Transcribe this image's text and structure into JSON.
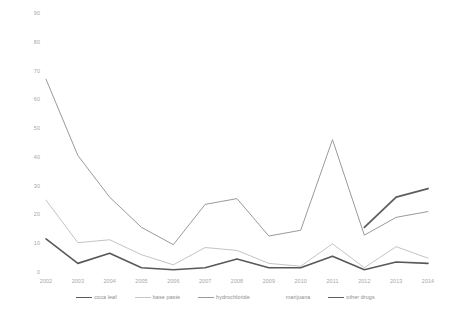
{
  "chart_data": {
    "type": "line",
    "title": "",
    "subtitle": "",
    "xlabel": "",
    "ylabel": "",
    "categories": [
      "2002",
      "2003",
      "2004",
      "2005",
      "2006",
      "2007",
      "2008",
      "2009",
      "2010",
      "2011",
      "2012",
      "2013",
      "2014"
    ],
    "x": [
      2002,
      2003,
      2004,
      2005,
      2006,
      2007,
      2008,
      2009,
      2010,
      2011,
      2012,
      2013,
      2014
    ],
    "ylim": [
      0,
      90
    ],
    "yticks": [
      0,
      10,
      20,
      30,
      40,
      50,
      60,
      70,
      80,
      90
    ],
    "ytick_labels": [
      "0",
      "10",
      "20",
      "30",
      "40",
      "50",
      "60",
      "70",
      "80",
      "90"
    ],
    "grid": false,
    "legend_position": "bottom",
    "series": [
      {
        "name": "coca leaf",
        "color": "#595959",
        "width": 1.6,
        "values": [
          11.5,
          3.0,
          6.5,
          1.5,
          0.8,
          1.5,
          4.5,
          1.5,
          1.5,
          5.5,
          0.8,
          3.5,
          3.0
        ]
      },
      {
        "name": "base paste",
        "color": "#c4c4c4",
        "width": 1.0,
        "values": [
          25.0,
          10.2,
          11.2,
          6.0,
          2.5,
          8.5,
          7.5,
          3.0,
          2.0,
          9.8,
          1.5,
          8.8,
          4.8
        ]
      },
      {
        "name": "hydrochloride",
        "color": "#9a9a9a",
        "width": 1.0,
        "values": [
          67.0,
          40.5,
          26.0,
          15.5,
          9.5,
          23.5,
          25.5,
          12.5,
          14.5,
          46.0,
          12.8,
          19.0,
          21.0
        ]
      },
      {
        "name": "marijuana",
        "color": "#fdfdfd",
        "width": 1.0,
        "values": [
          null,
          null,
          null,
          null,
          null,
          null,
          null,
          null,
          null,
          null,
          null,
          null,
          null
        ]
      },
      {
        "name": "other drugs",
        "color": "#5e5e5e",
        "width": 1.8,
        "values": [
          null,
          null,
          null,
          null,
          null,
          null,
          null,
          null,
          null,
          null,
          15.5,
          26.0,
          29.0
        ]
      }
    ]
  },
  "axis": {
    "y_tick_labels": [
      "90",
      "80",
      "70",
      "60",
      "50",
      "40",
      "30",
      "20",
      "10",
      "0"
    ],
    "x_tick_labels": [
      "2002",
      "2003",
      "2004",
      "2005",
      "2006",
      "2007",
      "2008",
      "2009",
      "2010",
      "2011",
      "2012",
      "2013",
      "2014"
    ]
  },
  "legend": {
    "items": [
      {
        "label": "coca leaf",
        "color": "#595959",
        "width": 1.8
      },
      {
        "label": "base paste",
        "color": "#c4c4c4",
        "width": 1.0
      },
      {
        "label": "hydrochloride",
        "color": "#9a9a9a",
        "width": 1.0
      },
      {
        "label": "marijuana",
        "color": "#fefefe",
        "width": 1.0
      },
      {
        "label": "other drugs",
        "color": "#5e5e5e",
        "width": 1.8
      }
    ]
  },
  "colors": {
    "background": "#ffffff",
    "axis_text": "#a6a6a6",
    "legend_text": "#8c8c8c"
  }
}
